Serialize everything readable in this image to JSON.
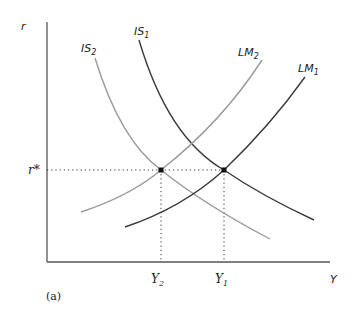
{
  "figure": {
    "caption": "(a)",
    "axes": {
      "y_label": "r",
      "x_label": "Y",
      "r_star_label": "r*",
      "y1_label": "Y",
      "y1_sub": "1",
      "y2_label": "Y",
      "y2_sub": "2"
    },
    "curves": {
      "is1": {
        "label": "IS",
        "sub": "1",
        "color": "#3a3a3a"
      },
      "is2": {
        "label": "IS",
        "sub": "2",
        "color": "#9a9a9a"
      },
      "lm1": {
        "label": "LM",
        "sub": "1",
        "color": "#3a3a3a"
      },
      "lm2": {
        "label": "LM",
        "sub": "2",
        "color": "#9a9a9a"
      }
    },
    "equilibria": [
      {
        "name": "IS2-LM2",
        "x_label": "Y2",
        "y_label": "r*"
      },
      {
        "name": "IS1-LM1",
        "x_label": "Y1",
        "y_label": "r*"
      }
    ]
  }
}
